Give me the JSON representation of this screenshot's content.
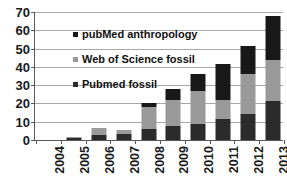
{
  "chart_data": {
    "type": "bar",
    "stacked": true,
    "title": "",
    "subtitle": "",
    "xlabel": "",
    "ylabel": "",
    "categories": [
      "2004",
      "2005",
      "2006",
      "2007",
      "2008",
      "2009",
      "2010",
      "2011",
      "2012",
      "2013"
    ],
    "ylim": [
      0,
      70
    ],
    "yticks": [
      0,
      10,
      20,
      30,
      40,
      50,
      60,
      70
    ],
    "ytick_labels": [
      "0",
      "10",
      "20",
      "30",
      "40",
      "50",
      "60",
      "70"
    ],
    "grid": true,
    "grid_axis": "y",
    "legend_position": "upper-left-inside",
    "series": [
      {
        "name": "Pubmed fossil",
        "color": "#2b2b2b",
        "values": [
          0,
          1,
          3,
          3.5,
          6,
          7.5,
          8.5,
          11.5,
          14.5,
          21.5
        ]
      },
      {
        "name": "Web of Science fossil",
        "color": "#9a9a9a",
        "values": [
          0,
          0.5,
          3.5,
          2,
          12,
          14.5,
          18.5,
          10.5,
          21.5,
          22.5
        ]
      },
      {
        "name": "pubMed anthropology",
        "color": "#181818",
        "values": [
          0,
          0,
          0,
          0,
          2.5,
          6,
          9,
          19.5,
          15.5,
          24
        ]
      }
    ],
    "totals": [
      0,
      1.5,
      6.5,
      5.5,
      20.5,
      28,
      36,
      41.5,
      51.5,
      68
    ],
    "legend_order": [
      "pubMed anthropology",
      "Web of Science fossil",
      "Pubmed fossil"
    ]
  },
  "style": {
    "axis_color": "#5a5a5a",
    "grid_color": "#a8a8a8",
    "text_color": "#1a1a1a",
    "background": "#ffffff"
  }
}
